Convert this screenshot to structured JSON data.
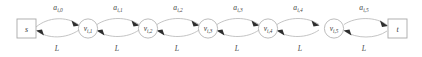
{
  "diagram": {
    "type": "directed-graph-chain",
    "title": "",
    "source_node": {
      "id": "s",
      "label": "s",
      "shape": "square"
    },
    "sink_node": {
      "id": "t",
      "label": "t",
      "shape": "square"
    },
    "nodes": [
      {
        "id": "v1",
        "label": "v",
        "sub": "i,1",
        "shape": "circle"
      },
      {
        "id": "v2",
        "label": "v",
        "sub": "i,2",
        "shape": "circle"
      },
      {
        "id": "v3",
        "label": "v",
        "sub": "i,3",
        "shape": "circle"
      },
      {
        "id": "v4",
        "label": "v",
        "sub": "i,4",
        "shape": "circle"
      },
      {
        "id": "v5",
        "label": "v",
        "sub": "i,5",
        "shape": "circle"
      }
    ],
    "forward_edges": [
      {
        "from": "s",
        "to": "v1",
        "label": "a",
        "sub": "i,0",
        "direction": "right"
      },
      {
        "from": "v1",
        "to": "v2",
        "label": "a",
        "sub": "i,1",
        "direction": "right"
      },
      {
        "from": "v2",
        "to": "v3",
        "label": "a",
        "sub": "i,2",
        "direction": "right"
      },
      {
        "from": "v3",
        "to": "v4",
        "label": "a",
        "sub": "i,3",
        "direction": "right"
      },
      {
        "from": "v4",
        "to": "v5",
        "label": "a",
        "sub": "i,4",
        "direction": "right"
      },
      {
        "from": "v5",
        "to": "t",
        "label": "a",
        "sub": "i,5",
        "direction": "right"
      }
    ],
    "backward_edges": [
      {
        "from": "v1",
        "to": "s",
        "label": "L",
        "direction": "left"
      },
      {
        "from": "v2",
        "to": "v1",
        "label": "L",
        "direction": "left"
      },
      {
        "from": "v3",
        "to": "v2",
        "label": "L",
        "direction": "left"
      },
      {
        "from": "v4",
        "to": "v3",
        "label": "L",
        "direction": "left"
      },
      {
        "from": "v5",
        "to": "v4",
        "label": "L",
        "direction": "left"
      },
      {
        "from": "t",
        "to": "v5",
        "label": "L",
        "direction": "left"
      }
    ],
    "colors": {
      "edge": "#b9b9b9",
      "arrowhead": "#2e2e2e",
      "node_stroke": "#b0b0b0",
      "text": "#3a3a3a",
      "background": "#ffffff"
    }
  }
}
